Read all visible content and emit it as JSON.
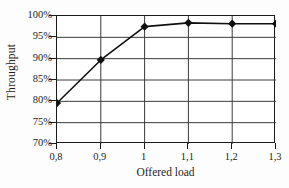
{
  "chart_data": {
    "type": "line",
    "title": "",
    "xlabel": "Offered load",
    "ylabel": "Throughput",
    "categories": [
      "0,8",
      "0,9",
      "1",
      "1,1",
      "1,2",
      "1,3"
    ],
    "x_values": [
      0.8,
      0.9,
      1.0,
      1.1,
      1.2,
      1.3
    ],
    "series": [
      {
        "name": "Throughput",
        "values": [
          79.6,
          89.7,
          97.5,
          98.4,
          98.2,
          98.2
        ],
        "marker": "diamond",
        "line_color": "#101010",
        "marker_color": "#101010"
      }
    ],
    "ylim": [
      70,
      100
    ],
    "ytick_values": [
      70,
      75,
      80,
      85,
      90,
      95,
      100
    ],
    "ytick_labels": [
      "70%",
      "75%",
      "80%",
      "85%",
      "90%",
      "95%",
      "100%"
    ],
    "xtick_labels": [
      "0,8",
      "0,9",
      "1",
      "1,1",
      "1,2",
      "1,3"
    ],
    "grid": "both",
    "grid_color": "#3a3a3a",
    "legend": "none",
    "frame": true,
    "background": "#ffffff"
  }
}
